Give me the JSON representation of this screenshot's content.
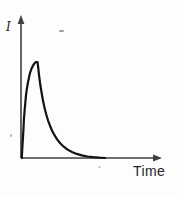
{
  "figure": {
    "y_axis_label": "I",
    "x_axis_label": "Time"
  },
  "colors": {
    "curve": "#121212",
    "axis": "#3f3f3f",
    "label": "#262626",
    "background": "#fdfdfc"
  },
  "chart_data": {
    "type": "line",
    "title": "",
    "xlabel": "Time",
    "ylabel": "I",
    "x_ticks": [],
    "y_ticks": [],
    "grid": false,
    "legend": false,
    "axis_style": "arrows",
    "xlim": [
      0,
      1
    ],
    "ylim": [
      0,
      1.45
    ],
    "series": [
      {
        "name": "I(t)",
        "points": [
          [
            0.006,
            0.0
          ],
          [
            0.008,
            0.06
          ],
          [
            0.011,
            0.14
          ],
          [
            0.014,
            0.22
          ],
          [
            0.018,
            0.31
          ],
          [
            0.021,
            0.4
          ],
          [
            0.025,
            0.48
          ],
          [
            0.029,
            0.55
          ],
          [
            0.036,
            0.655
          ],
          [
            0.043,
            0.73
          ],
          [
            0.05,
            0.79
          ],
          [
            0.057,
            0.84
          ],
          [
            0.064,
            0.885
          ],
          [
            0.075,
            0.93
          ],
          [
            0.086,
            0.962
          ],
          [
            0.096,
            0.985
          ],
          [
            0.107,
            1.0
          ],
          [
            0.118,
            1.0
          ],
          [
            0.123,
            0.945
          ],
          [
            0.127,
            0.885
          ],
          [
            0.132,
            0.825
          ],
          [
            0.138,
            0.762
          ],
          [
            0.145,
            0.698
          ],
          [
            0.152,
            0.638
          ],
          [
            0.16,
            0.578
          ],
          [
            0.17,
            0.513
          ],
          [
            0.18,
            0.455
          ],
          [
            0.193,
            0.393
          ],
          [
            0.207,
            0.336
          ],
          [
            0.222,
            0.284
          ],
          [
            0.239,
            0.237
          ],
          [
            0.258,
            0.194
          ],
          [
            0.28,
            0.154
          ],
          [
            0.305,
            0.118
          ],
          [
            0.333,
            0.088
          ],
          [
            0.364,
            0.063
          ],
          [
            0.398,
            0.043
          ],
          [
            0.435,
            0.027
          ],
          [
            0.474,
            0.016
          ],
          [
            0.515,
            0.008
          ],
          [
            0.557,
            0.003
          ],
          [
            0.6,
            0.0
          ]
        ]
      }
    ]
  }
}
